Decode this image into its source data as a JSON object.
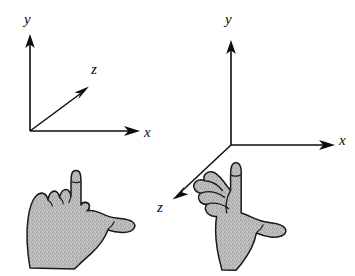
{
  "figure": {
    "type": "diagram",
    "background_color": "#ffffff",
    "ink_color": "#0d0d0d",
    "hand_fill_color": "#b8b8b8",
    "hand_outline_color": "#1a1a1a",
    "panels": [
      {
        "id": "left-handed",
        "name": "left-handed-coordinate-system",
        "origin": {
          "x": 30,
          "y": 131
        },
        "axes": [
          {
            "name": "y-axis",
            "label": "y",
            "label_x": 24,
            "label_y": 12,
            "from": {
              "x": 30,
              "y": 131
            },
            "to": {
              "x": 30,
              "y": 36
            },
            "direction": "up"
          },
          {
            "name": "x-axis",
            "label": "x",
            "label_x": 144,
            "label_y": 125,
            "from": {
              "x": 30,
              "y": 131
            },
            "to": {
              "x": 140,
              "y": 131
            },
            "direction": "right"
          },
          {
            "name": "z-axis",
            "label": "z",
            "label_x": 91,
            "label_y": 62,
            "from": {
              "x": 30,
              "y": 131
            },
            "to": {
              "x": 89,
              "y": 86
            },
            "direction": "up-right"
          }
        ],
        "hand": {
          "name": "left-hand",
          "pose": "index-finger-up-thumb-right",
          "thumb_direction": "right",
          "index_direction": "up",
          "fingers_curled": "toward-viewer"
        }
      },
      {
        "id": "right-handed",
        "name": "right-handed-coordinate-system",
        "origin": {
          "x": 231,
          "y": 145
        },
        "axes": [
          {
            "name": "y-axis",
            "label": "y",
            "label_x": 225,
            "label_y": 12,
            "from": {
              "x": 231,
              "y": 145
            },
            "to": {
              "x": 231,
              "y": 42
            },
            "direction": "up"
          },
          {
            "name": "x-axis",
            "label": "x",
            "label_x": 339,
            "label_y": 133,
            "from": {
              "x": 231,
              "y": 145
            },
            "to": {
              "x": 335,
              "y": 145
            },
            "direction": "right"
          },
          {
            "name": "z-axis",
            "label": "z",
            "label_x": 157,
            "label_y": 200,
            "from": {
              "x": 231,
              "y": 145
            },
            "to": {
              "x": 173,
              "y": 199
            },
            "direction": "down-left"
          }
        ],
        "hand": {
          "name": "right-hand",
          "pose": "index-finger-up-thumb-right",
          "thumb_direction": "right",
          "index_direction": "up",
          "fingers_curled": "away-from-viewer"
        }
      }
    ]
  }
}
